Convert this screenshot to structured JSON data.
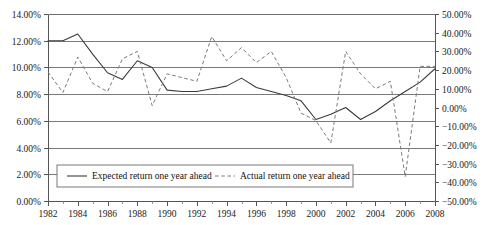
{
  "chart_data": {
    "type": "line",
    "title": "",
    "subtitle": "",
    "xlabel": "",
    "ylabel": "",
    "grid": true,
    "legend_position": "bottom-center",
    "x": [
      1982,
      1983,
      1984,
      1985,
      1986,
      1987,
      1988,
      1989,
      1990,
      1991,
      1992,
      1993,
      1994,
      1995,
      1996,
      1997,
      1998,
      1999,
      2000,
      2001,
      2002,
      2003,
      2004,
      2005,
      2006,
      2007,
      2008
    ],
    "xlim": [
      1982,
      2008
    ],
    "xticks": [
      1982,
      1984,
      1986,
      1988,
      1990,
      1992,
      1994,
      1996,
      1998,
      2000,
      2002,
      2004,
      2006,
      2008
    ],
    "xticklabels": [
      "1982",
      "1984",
      "1986",
      "1988",
      "1990",
      "1992",
      "1994",
      "1996",
      "1998",
      "2000",
      "2002",
      "2004",
      "2006",
      "2008"
    ],
    "axes": [
      {
        "id": "left",
        "side": "left",
        "ylim": [
          0.0,
          14.0
        ],
        "yticks": [
          0.0,
          2.0,
          4.0,
          6.0,
          8.0,
          10.0,
          12.0,
          14.0
        ],
        "yticklabels": [
          "0.00%",
          "2.00%",
          "4.00%",
          "6.00%",
          "8.00%",
          "10.00%",
          "12.00%",
          "14.00%"
        ]
      },
      {
        "id": "right",
        "side": "right",
        "ylim": [
          -50.0,
          50.0
        ],
        "yticks": [
          -50.0,
          -40.0,
          -30.0,
          -20.0,
          -10.0,
          0.0,
          10.0,
          20.0,
          30.0,
          40.0,
          50.0
        ],
        "yticklabels": [
          "−50.00%",
          "−40.00%",
          "−30.00%",
          "−20.00%",
          "−10.00%",
          "0.00%",
          "10.00%",
          "20.00%",
          "30.00%",
          "40.00%",
          "50.00%"
        ]
      }
    ],
    "series": [
      {
        "name": "Expected return one year ahead",
        "key": "expected",
        "axis": "left",
        "style": "solid",
        "color": "#3b3b3b",
        "values": [
          12.0,
          12.0,
          12.5,
          11.0,
          9.6,
          9.1,
          10.5,
          10.0,
          8.3,
          8.2,
          8.2,
          8.4,
          8.6,
          9.2,
          8.5,
          8.2,
          7.9,
          7.5,
          6.1,
          6.5,
          7.0,
          6.1,
          6.7,
          7.5,
          8.2,
          8.9,
          9.9
        ]
      },
      {
        "name": "Actual return one year ahead",
        "key": "actual",
        "axis": "right",
        "style": "dashed",
        "color": "#7a7a7a",
        "values": [
          19.0,
          8.0,
          27.0,
          13.0,
          8.5,
          26.0,
          30.0,
          1.0,
          18.0,
          16.0,
          14.0,
          38.0,
          25.0,
          32.0,
          24.0,
          30.0,
          16.0,
          -3.0,
          -7.0,
          -19.0,
          30.0,
          18.0,
          10.0,
          14.0,
          -37.0,
          22.0,
          22.0
        ]
      }
    ],
    "legend": [
      {
        "label": "Expected return one year ahead",
        "style": "solid",
        "color": "#3b3b3b"
      },
      {
        "label": "Actual return one year ahead",
        "style": "dashed",
        "color": "#7a7a7a"
      }
    ]
  },
  "colors": {
    "background": "#ffffff",
    "axis": "#555555",
    "grid": "#6b6b6b",
    "expected_series": "#3b3b3b",
    "actual_series": "#7a7a7a",
    "text": "#111111"
  }
}
